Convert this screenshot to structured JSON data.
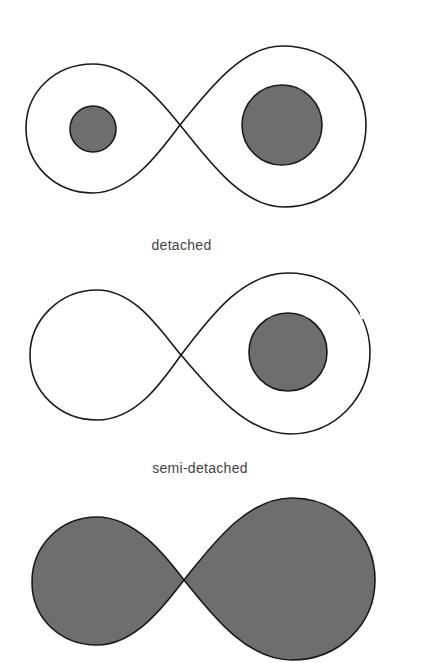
{
  "figure": {
    "panels": [
      {
        "id": "detached",
        "label": "detached",
        "filled_lobes": false,
        "stars": [
          "small-left",
          "large-right"
        ]
      },
      {
        "id": "semi-detached",
        "label": "semi-detached",
        "filled_lobes": "left-lobe-empty, right star inside lobe",
        "stars": [
          "large-right"
        ]
      },
      {
        "id": "contact",
        "label": "",
        "filled_lobes": true,
        "stars": []
      }
    ],
    "colors": {
      "outline": "#1a1a1a",
      "star_fill": "#6e6e6e",
      "background": "#ffffff",
      "label": "#444444"
    }
  }
}
